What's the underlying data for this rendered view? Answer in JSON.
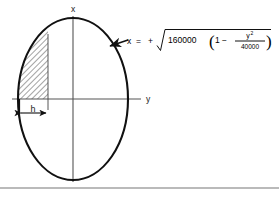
{
  "figure": {
    "caption_equation_plain": "x = + sqrt( 160000 ( 1 - y^2 / 40000 ) )",
    "axes": {
      "vertical_label": "x",
      "horizontal_label": "y"
    },
    "dimension": {
      "label": "h"
    },
    "equation": {
      "variable": "x",
      "equals": "=",
      "sign": "+",
      "radicand_coefficient": "160000",
      "paren_open": "(",
      "one": "1",
      "minus": "−",
      "numerator": "y",
      "numerator_exponent": "2",
      "denominator": "40000",
      "paren_close": ")"
    },
    "colors": {
      "curve": "#111111",
      "axis": "#555555",
      "hatch": "#333333",
      "rule": "#777777",
      "background": "#ffffff"
    },
    "geometry": {
      "ellipse_center_x": 73,
      "ellipse_center_y": 99,
      "ellipse_radius_x": 55,
      "ellipse_radius_y": 81,
      "shaded_right_edge_x": 48,
      "shaded_left_edge_x": 19
    }
  }
}
